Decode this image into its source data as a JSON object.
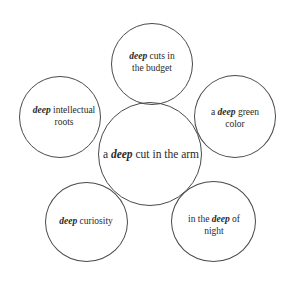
{
  "diagram": {
    "type": "radial-circles",
    "center": {
      "pre": "a ",
      "keyword": "deep",
      "post": " cut in the arm"
    },
    "satellites": [
      {
        "position": "top",
        "line1_pre": "",
        "keyword": "deep",
        "line1_post": " cuts in",
        "line2": "the budget"
      },
      {
        "position": "upper-right",
        "line1_pre": "a ",
        "keyword": "deep",
        "line1_post": " green",
        "line2": "color"
      },
      {
        "position": "lower-right",
        "line1_pre": "in the ",
        "keyword": "deep",
        "line1_post": " of",
        "line2": "night"
      },
      {
        "position": "lower-left",
        "line1_pre": "",
        "keyword": "deep",
        "line1_post": " curiosity",
        "line2": ""
      },
      {
        "position": "upper-left",
        "line1_pre": "",
        "keyword": "deep",
        "line1_post": " intellectual",
        "line2": "roots"
      }
    ],
    "colors": {
      "stroke": "#4a4a4a",
      "text": "#2a2a2a",
      "background": "#ffffff"
    }
  }
}
